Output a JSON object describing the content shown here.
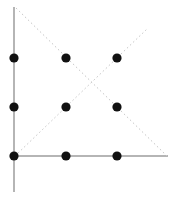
{
  "figure": {
    "canvas": {
      "width": 178,
      "height": 201,
      "background": "#ffffff"
    },
    "style": {
      "dot_color": "#111111",
      "dot_radius": 4.6,
      "solid_line_color": "#b5b5b5",
      "solid_line_width": 2,
      "dotted_line_color": "#c8c8c8",
      "dotted_line_width": 1,
      "dotted_dash": "1.6 2.6"
    },
    "points": [
      {
        "id": "p-top-left",
        "label": "top-left",
        "x": 14,
        "y": 58
      },
      {
        "id": "p-top-center",
        "label": "top-center",
        "x": 66,
        "y": 58
      },
      {
        "id": "p-top-right",
        "label": "top-right",
        "x": 117,
        "y": 58
      },
      {
        "id": "p-middle-left",
        "label": "middle-left",
        "x": 14,
        "y": 107
      },
      {
        "id": "p-middle-center",
        "label": "middle-center",
        "x": 66,
        "y": 107
      },
      {
        "id": "p-middle-right",
        "label": "middle-right",
        "x": 117,
        "y": 107
      },
      {
        "id": "p-bottom-left",
        "label": "bottom-left",
        "x": 14,
        "y": 156
      },
      {
        "id": "p-bottom-center",
        "label": "bottom-center",
        "x": 66,
        "y": 156
      },
      {
        "id": "p-bottom-right",
        "label": "bottom-right",
        "x": 117,
        "y": 156
      }
    ],
    "lines": [
      {
        "id": "line-vertical-axis",
        "label": "vertical-axis",
        "style": "solid",
        "x1": 14,
        "y1": 7,
        "x2": 14,
        "y2": 192
      },
      {
        "id": "line-horizontal-axis",
        "label": "horizontal-axis",
        "style": "solid",
        "x1": 10,
        "y1": 156,
        "x2": 168,
        "y2": 156
      },
      {
        "id": "line-diagonal-descending",
        "label": "diagonal-descending",
        "style": "dotted",
        "x1": 16,
        "y1": 8,
        "x2": 168,
        "y2": 157
      },
      {
        "id": "line-diagonal-ascending",
        "label": "diagonal-ascending",
        "style": "dotted",
        "x1": 15,
        "y1": 156,
        "x2": 147,
        "y2": 29
      }
    ]
  }
}
